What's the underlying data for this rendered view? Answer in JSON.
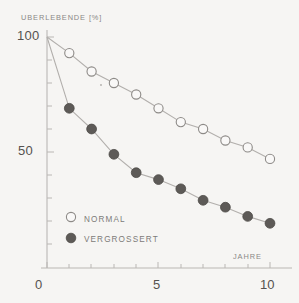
{
  "chart_data": {
    "type": "line",
    "title": "",
    "subtitle": "",
    "xlabel": "JAHRE",
    "ylabel": "UBERLEBENDE [%]",
    "x": [
      0,
      1,
      2,
      3,
      4,
      5,
      6,
      7,
      8,
      9,
      10
    ],
    "xlim": [
      0,
      10.6
    ],
    "ylim": [
      0,
      100
    ],
    "xticks": [
      0,
      5,
      10
    ],
    "xtick_labels": [
      "0",
      "5",
      "10"
    ],
    "yticks": [
      50,
      100
    ],
    "ytick_labels": [
      "50",
      "100"
    ],
    "y_minor_ticks": [
      10,
      20,
      30,
      40,
      60,
      70,
      80,
      90
    ],
    "grid": false,
    "legend_position": "lower left",
    "series": [
      {
        "name": "NORMAL",
        "marker": "open-circle",
        "values": [
          100,
          93,
          85,
          80,
          75,
          69,
          63,
          60,
          55,
          52,
          47
        ]
      },
      {
        "name": "VERGROSSERT",
        "marker": "filled-circle",
        "values": [
          100,
          69,
          60,
          49,
          41,
          38,
          34,
          29,
          26,
          22,
          19
        ]
      }
    ]
  },
  "legend": {
    "items": [
      {
        "label": "NORMAL",
        "marker": "open-circle"
      },
      {
        "label": "VERGROSSERT",
        "marker": "filled-circle"
      }
    ]
  },
  "axes": {
    "y_axis_title": "UBERLEBENDE [%]",
    "x_axis_title": "JAHRE",
    "y_tick_top": "100",
    "y_tick_mid": "50",
    "x_tick_min": "0",
    "x_tick_mid": "5",
    "x_tick_max": "10"
  },
  "colors": {
    "background": "#f6f5f3",
    "axis": "#b9b6b3",
    "line": "#b2afac",
    "marker_fill_enlarged": "#5d5a57",
    "marker_edge": "#8d8a87",
    "marker_fill_normal": "#f9f8f7",
    "text": "#55524f",
    "label_text": "#8a8886"
  }
}
